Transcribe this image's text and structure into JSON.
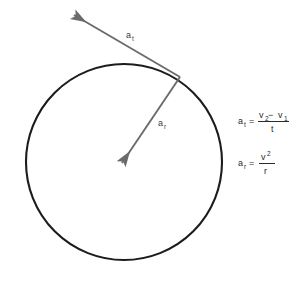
{
  "figure": {
    "background_color": "#ffffff",
    "circle": {
      "name": "circular-path",
      "center_x": 124,
      "center_y": 162,
      "radius": 98,
      "stroke_color": "#1c1c1c",
      "stroke_width": 2.1,
      "fill": "none"
    },
    "vectors": [
      {
        "id": "tangential",
        "label": "a",
        "subscript": "t",
        "label_x": 126,
        "label_y": 36,
        "from_x": 180,
        "from_y": 77,
        "to_x": 71,
        "to_y": 13,
        "color": "#6b6b6b",
        "stroke_width": 1.9
      },
      {
        "id": "radial",
        "label": "a",
        "subscript": "r",
        "label_x": 158,
        "label_y": 124,
        "from_x": 180,
        "from_y": 77,
        "to_x": 120,
        "to_y": 166,
        "color": "#6b6b6b",
        "stroke_width": 1.9
      }
    ],
    "equations": [
      {
        "id": "tangential-acceleration-equation",
        "lhs_var": "a",
        "lhs_sub": "t",
        "equals": "=",
        "numerator": "v₂ − v₁",
        "numerator_parts": [
          "v",
          "2",
          " − ",
          "v",
          "1"
        ],
        "denominator": "t",
        "plain": "a_t = (v₂ − v₁) / t",
        "x": 238,
        "y": 122
      },
      {
        "id": "radial-acceleration-equation",
        "lhs_var": "a",
        "lhs_sub": "r",
        "equals": "=",
        "numerator": "v²",
        "numerator_base": "v",
        "numerator_exp": "2",
        "denominator": "r",
        "plain": "a_r = v² / r",
        "x": 238,
        "y": 164
      }
    ]
  }
}
